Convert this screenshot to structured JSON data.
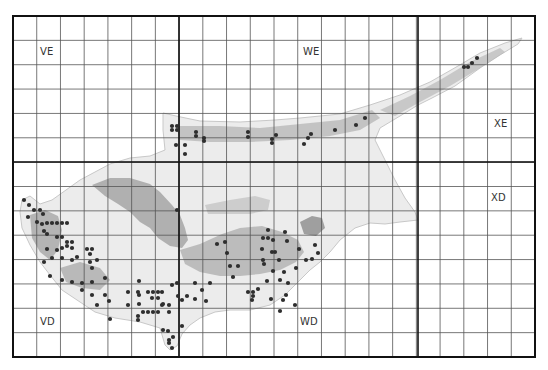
{
  "map": {
    "frame": {
      "x": 13,
      "y": 16,
      "width": 522,
      "height": 341
    },
    "grid": {
      "cols": 22,
      "rows": 14,
      "minor_color": "#555555",
      "major_color": "#111111"
    },
    "major_lines": {
      "x": [
        179,
        418
      ],
      "y": [
        162
      ]
    },
    "squares": [
      {
        "label": "VE",
        "x": 40,
        "y": 52
      },
      {
        "label": "WE",
        "x": 303,
        "y": 52
      },
      {
        "label": "XE",
        "x": 494,
        "y": 124
      },
      {
        "label": "VD",
        "x": 40,
        "y": 322
      },
      {
        "label": "WD",
        "x": 300,
        "y": 322
      },
      {
        "label": "XD",
        "x": 491,
        "y": 198
      }
    ],
    "island_colors": {
      "land": "#e8e8e8",
      "mountain": "#9a9a9a",
      "outline": "#c9c9c9"
    },
    "record_dot_color": "#2e2e2e",
    "records": [
      [
        24,
        200
      ],
      [
        29,
        205
      ],
      [
        34,
        210
      ],
      [
        40,
        210
      ],
      [
        43,
        214
      ],
      [
        28,
        217
      ],
      [
        37,
        222
      ],
      [
        42,
        224
      ],
      [
        47,
        223
      ],
      [
        52,
        223
      ],
      [
        57,
        223
      ],
      [
        62,
        223
      ],
      [
        67,
        223
      ],
      [
        44,
        231
      ],
      [
        47,
        234
      ],
      [
        57,
        237
      ],
      [
        62,
        237
      ],
      [
        67,
        242
      ],
      [
        72,
        242
      ],
      [
        67,
        246
      ],
      [
        62,
        248
      ],
      [
        72,
        248
      ],
      [
        47,
        249
      ],
      [
        57,
        250
      ],
      [
        52,
        258
      ],
      [
        62,
        258
      ],
      [
        72,
        260
      ],
      [
        77,
        257
      ],
      [
        87,
        249
      ],
      [
        92,
        249
      ],
      [
        90,
        254
      ],
      [
        90,
        262
      ],
      [
        92,
        268
      ],
      [
        97,
        260
      ],
      [
        44,
        262
      ],
      [
        50,
        276
      ],
      [
        62,
        280
      ],
      [
        72,
        282
      ],
      [
        82,
        283
      ],
      [
        92,
        282
      ],
      [
        105,
        278
      ],
      [
        82,
        290
      ],
      [
        92,
        295
      ],
      [
        97,
        305
      ],
      [
        109,
        301
      ],
      [
        128,
        292
      ],
      [
        138,
        292
      ],
      [
        139,
        281
      ],
      [
        105,
        295
      ],
      [
        128,
        305
      ],
      [
        139,
        295
      ],
      [
        139,
        304
      ],
      [
        148,
        292
      ],
      [
        153,
        292
      ],
      [
        158,
        292
      ],
      [
        162,
        292
      ],
      [
        152,
        298
      ],
      [
        158,
        298
      ],
      [
        162,
        305
      ],
      [
        143,
        312
      ],
      [
        148,
        312
      ],
      [
        153,
        312
      ],
      [
        158,
        312
      ],
      [
        163,
        304
      ],
      [
        169,
        305
      ],
      [
        169,
        312
      ],
      [
        172,
        285
      ],
      [
        177,
        283
      ],
      [
        178,
        296
      ],
      [
        182,
        300
      ],
      [
        187,
        296
      ],
      [
        195,
        283
      ],
      [
        202,
        290
      ],
      [
        206,
        301
      ],
      [
        210,
        283
      ],
      [
        195,
        299
      ],
      [
        110,
        319
      ],
      [
        138,
        320
      ],
      [
        138,
        316
      ],
      [
        163,
        330
      ],
      [
        168,
        331
      ],
      [
        169,
        340
      ],
      [
        173,
        337
      ],
      [
        172,
        348
      ],
      [
        169,
        343
      ],
      [
        182,
        326
      ],
      [
        177,
        210
      ],
      [
        217,
        244
      ],
      [
        225,
        242
      ],
      [
        227,
        253
      ],
      [
        230,
        266
      ],
      [
        238,
        266
      ],
      [
        233,
        277
      ],
      [
        248,
        292
      ],
      [
        253,
        292
      ],
      [
        253,
        296
      ],
      [
        258,
        289
      ],
      [
        263,
        260
      ],
      [
        272,
        252
      ],
      [
        273,
        240
      ],
      [
        263,
        238
      ],
      [
        268,
        238
      ],
      [
        262,
        249
      ],
      [
        264,
        264
      ],
      [
        275,
        252
      ],
      [
        273,
        271
      ],
      [
        279,
        260
      ],
      [
        280,
        280
      ],
      [
        284,
        272
      ],
      [
        267,
        281
      ],
      [
        288,
        283
      ],
      [
        296,
        268
      ],
      [
        286,
        295
      ],
      [
        295,
        305
      ],
      [
        306,
        260
      ],
      [
        312,
        259
      ],
      [
        318,
        253
      ],
      [
        315,
        245
      ],
      [
        299,
        249
      ],
      [
        287,
        241
      ],
      [
        285,
        232
      ],
      [
        268,
        230
      ],
      [
        252,
        300
      ],
      [
        283,
        300
      ],
      [
        280,
        311
      ],
      [
        271,
        299
      ],
      [
        172,
        126
      ],
      [
        177,
        126
      ],
      [
        172,
        130
      ],
      [
        177,
        130
      ],
      [
        176,
        145
      ],
      [
        185,
        145
      ],
      [
        185,
        154
      ],
      [
        196,
        132
      ],
      [
        196,
        136
      ],
      [
        204,
        138
      ],
      [
        204,
        141
      ],
      [
        248,
        132
      ],
      [
        248,
        137
      ],
      [
        272,
        139
      ],
      [
        276,
        135
      ],
      [
        272,
        143
      ],
      [
        304,
        144
      ],
      [
        308,
        138
      ],
      [
        311,
        134
      ],
      [
        335,
        130
      ],
      [
        356,
        125
      ],
      [
        365,
        118
      ],
      [
        464,
        67
      ],
      [
        468,
        67
      ],
      [
        472,
        63
      ],
      [
        477,
        58
      ]
    ]
  }
}
